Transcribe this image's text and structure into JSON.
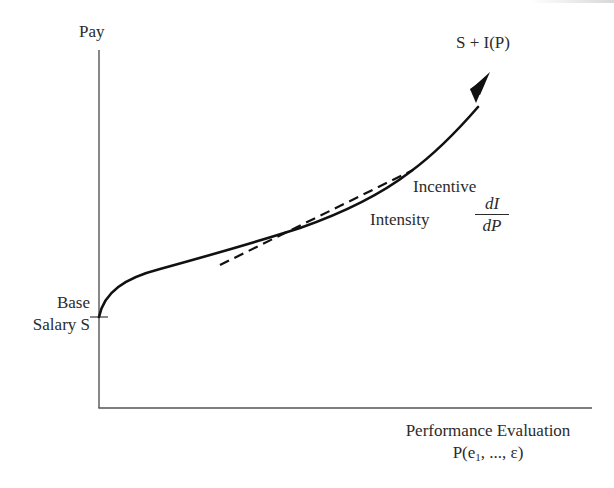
{
  "diagram": {
    "type": "incentive-pay-schedule",
    "y_axis": {
      "label": "Pay"
    },
    "x_axis": {
      "label_line1": "Performance Evaluation",
      "label_line2_prefix": "P(e",
      "label_line2_subscript": "1",
      "label_line2_suffix": ", ..., ε)"
    },
    "curve": {
      "label": "S + I(P)",
      "style": "solid",
      "end_marker": "arrow"
    },
    "intercept": {
      "label_line1": "Base",
      "label_line2": "Salary S"
    },
    "tangent": {
      "style": "dashed",
      "label_line1": "Incentive",
      "label_line2": "Intensity",
      "fraction_numerator": "dI",
      "fraction_denominator": "dP"
    },
    "colors": {
      "line": "#111111",
      "axis": "#555555",
      "text": "#2b2b2b",
      "background": "#ffffff"
    }
  }
}
